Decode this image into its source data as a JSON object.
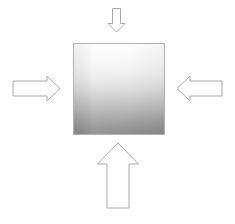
{
  "figure": {
    "title": "",
    "background_color": "#ffffff",
    "width": 235,
    "height": 224
  },
  "block": {
    "name": "central-square-block",
    "label": "",
    "x": 73,
    "y": 43,
    "width": 92,
    "height": 92,
    "gradient_direction": "vertical",
    "gradient_top_color": "#fcfcfc",
    "gradient_mid_color": "#e2e2e2",
    "gradient_bottom_color": "#8d8d8d",
    "border_color": "#b4b4b4"
  },
  "arrows": [
    {
      "id": "top-arrow",
      "label": "",
      "direction": "down",
      "points_toward": "block-top-edge",
      "size": "small",
      "tip_x": 116,
      "tip_y": 32,
      "shaft_width": 7,
      "head_width": 17,
      "total_length": 24,
      "fill_color": "#ffffff",
      "stroke_color": "#a8a8a8"
    },
    {
      "id": "left-arrow",
      "label": "",
      "direction": "right",
      "points_toward": "block-left-edge",
      "size": "medium",
      "tip_x": 60,
      "tip_y": 88,
      "shaft_width": 14,
      "head_width": 25,
      "total_length": 48,
      "fill_color": "#ffffff",
      "stroke_color": "#a8a8a8"
    },
    {
      "id": "right-arrow",
      "label": "",
      "direction": "left",
      "points_toward": "block-right-edge",
      "size": "medium",
      "tip_x": 177,
      "tip_y": 88,
      "shaft_width": 14,
      "head_width": 25,
      "total_length": 45,
      "fill_color": "#ffffff",
      "stroke_color": "#a8a8a8"
    },
    {
      "id": "bottom-arrow",
      "label": "",
      "direction": "up",
      "points_toward": "block-bottom-edge",
      "size": "large",
      "tip_x": 118,
      "tip_y": 143,
      "shaft_width": 23,
      "head_width": 41,
      "total_length": 65,
      "fill_color": "#ffffff",
      "stroke_color": "#a8a8a8"
    }
  ],
  "captions": []
}
